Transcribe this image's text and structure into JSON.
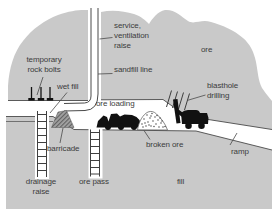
{
  "diagram": {
    "labels": {
      "temporary_rock_bolts": {
        "line1": "temporary",
        "line2": "rock bolts"
      },
      "wet_fill": "wet fill",
      "service_ventilation_raise": {
        "line1": "service,",
        "line2": "ventilation",
        "line3": "raise"
      },
      "sandfill_line": "sandfill line",
      "ore": "ore",
      "blasthole_drilling": {
        "line1": "blasthole",
        "line2": "drilling"
      },
      "ore_loading": "ore loading",
      "broken_ore": "broken ore",
      "ramp": "ramp",
      "barricade": "barricade",
      "drainage_raise": {
        "line1": "drainage",
        "line2": "raise"
      },
      "ore_pass": "ore pass",
      "fill": "fill"
    },
    "colors": {
      "rock": "#c9c9c9",
      "outline": "#4a4a4a",
      "machine": "#111111",
      "text": "#3c3c3c",
      "background": "#ffffff"
    }
  }
}
